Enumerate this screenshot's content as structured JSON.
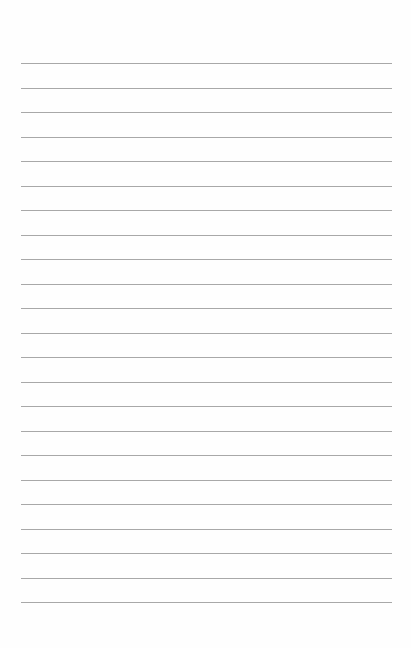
{
  "page": {
    "type": "lined-paper",
    "line_count": 23,
    "first_line_y": 63,
    "line_spacing": 24.5,
    "line_color": "#a8a8a8",
    "background_color": "#fefefe",
    "text": ""
  }
}
